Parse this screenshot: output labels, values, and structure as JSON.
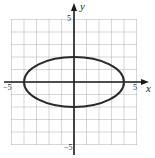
{
  "chart_data": {
    "type": "line",
    "title": "",
    "xlabel": "x",
    "ylabel": "y",
    "xlim": [
      -5,
      5
    ],
    "ylim": [
      -5,
      5
    ],
    "grid": true,
    "tick_labels": {
      "x": [
        "−5",
        "5"
      ],
      "y": [
        "5",
        "−5"
      ]
    },
    "series": [
      {
        "name": "ellipse",
        "equation": "x^2/16 + y^2/4 = 1",
        "center": [
          0,
          0
        ],
        "semi_major_x": 4,
        "semi_minor_y": 2,
        "vertices": [
          [
            -4,
            0
          ],
          [
            4,
            0
          ],
          [
            0,
            2
          ],
          [
            0,
            -2
          ]
        ]
      }
    ]
  },
  "labels": {
    "x_axis": "x",
    "y_axis": "y",
    "x_min_tick": "−5",
    "x_max_tick": "5",
    "y_max_tick": "5",
    "y_min_tick": "−5"
  }
}
